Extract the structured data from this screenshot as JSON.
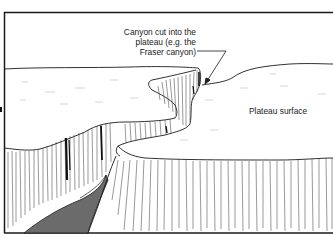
{
  "diagram": {
    "type": "landform-sketch",
    "labels": {
      "canyon": {
        "line1": "Canyon cut into the",
        "line2": "plateau (e.g. the",
        "line3": "Fraser canyon)"
      },
      "plateau": "Plateau surface"
    },
    "colors": {
      "ink": "#1a1a1a",
      "river": "#6b6b6b",
      "paper": "#ffffff"
    }
  }
}
